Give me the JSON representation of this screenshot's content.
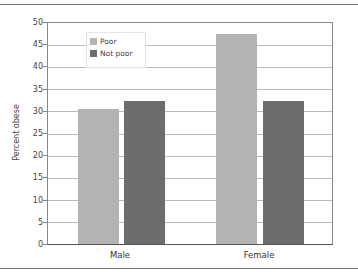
{
  "chart_data": {
    "type": "bar",
    "title": "",
    "xlabel": "",
    "ylabel": "Percent obese",
    "ylim": [
      0,
      50
    ],
    "yticks": [
      0,
      5,
      10,
      15,
      20,
      25,
      30,
      35,
      40,
      45,
      50
    ],
    "grid": true,
    "legend_position": "upper-left-inside",
    "categories": [
      "Male",
      "Female"
    ],
    "series": [
      {
        "name": "Poor",
        "color": "#b3b3b3",
        "values": [
          30.5,
          47.5
        ]
      },
      {
        "name": "Not poor",
        "color": "#6d6d6d",
        "values": [
          32.3,
          32.4
        ]
      }
    ]
  },
  "axis": {
    "ylabel": "Percent obese",
    "ticks": [
      "0",
      "5",
      "10",
      "15",
      "20",
      "25",
      "30",
      "35",
      "40",
      "45",
      "50"
    ]
  },
  "legend": {
    "items": [
      {
        "label": "Poor",
        "color": "#b3b3b3"
      },
      {
        "label": "Not poor",
        "color": "#6d6d6d"
      }
    ]
  },
  "xaxis": {
    "labels": [
      "Male",
      "Female"
    ]
  }
}
